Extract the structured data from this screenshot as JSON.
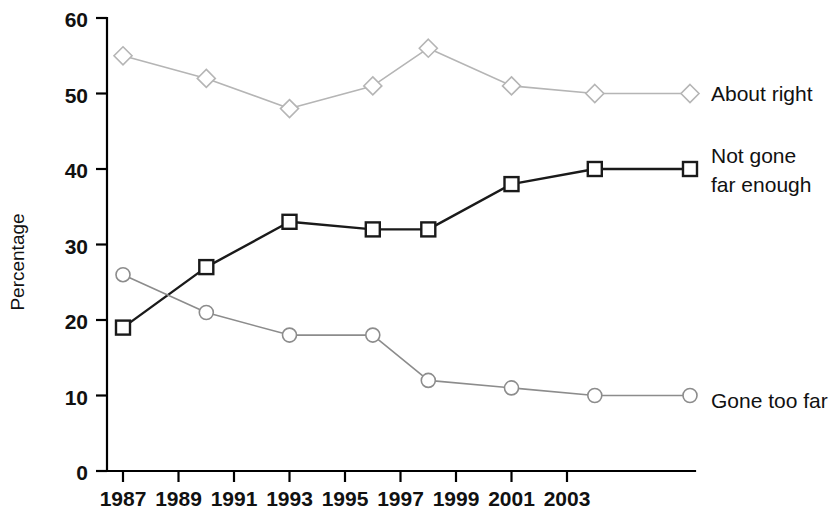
{
  "chart_data": {
    "type": "line",
    "title": "",
    "subtitle": "",
    "xlabel": "",
    "ylabel": "Percentage",
    "x": [
      1987,
      1990,
      1993,
      1996,
      1998,
      2001,
      2004
    ],
    "xtick_labels": [
      "1987",
      "1989",
      "1991",
      "1993",
      "1995",
      "1997",
      "1999",
      "2001",
      "2003"
    ],
    "xtick_values": [
      1987,
      1989,
      1991,
      1993,
      1995,
      1997,
      1999,
      2001,
      2003
    ],
    "ytick_labels": [
      "0",
      "10",
      "20",
      "30",
      "40",
      "50",
      "60"
    ],
    "ytick_values": [
      0,
      10,
      20,
      30,
      40,
      50,
      60
    ],
    "xlim": [
      1986,
      2004.6
    ],
    "ylim": [
      0,
      60
    ],
    "grid": false,
    "legend_position": "right-inline-labels",
    "series": [
      {
        "name": "About right",
        "label": "About right",
        "marker": "diamond",
        "color": "#b5b5b5",
        "values": [
          55,
          52,
          48,
          51,
          56,
          51,
          50
        ]
      },
      {
        "name": "Not gone far enough",
        "label": "Not gone\nfar enough",
        "label_line1": "Not gone",
        "label_line2": "far enough",
        "marker": "square",
        "color": "#1a1a1a",
        "values": [
          19,
          27,
          33,
          32,
          32,
          38,
          40
        ]
      },
      {
        "name": "Gone too far",
        "label": "Gone too far",
        "marker": "circle",
        "color": "#8c8c8c",
        "values": [
          26,
          21,
          18,
          18,
          12,
          11,
          10
        ]
      }
    ]
  },
  "axes": {
    "y_title": "Percentage",
    "y_ticks": [
      "60",
      "50",
      "40",
      "30",
      "20",
      "10",
      "0"
    ],
    "x_ticks": [
      "1987",
      "1989",
      "1991",
      "1993",
      "1995",
      "1997",
      "1999",
      "2001",
      "2003"
    ]
  },
  "labels": {
    "about_right": "About right",
    "not_gone_1": "Not gone",
    "not_gone_2": "far enough",
    "gone_too_far": "Gone too far"
  },
  "colors": {
    "series_about_right": "#b5b5b5",
    "series_not_gone": "#1a1a1a",
    "series_gone_too_far": "#8c8c8c",
    "axis": "#000000",
    "background": "#ffffff"
  }
}
